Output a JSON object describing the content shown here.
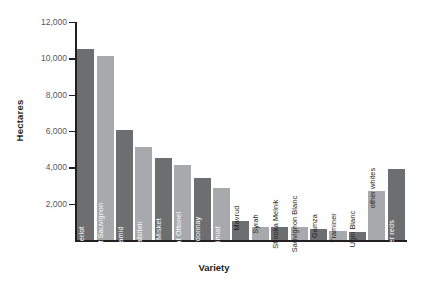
{
  "chart_data": {
    "type": "bar",
    "title": "",
    "xlabel": "Variety",
    "ylabel": "Hectares",
    "ylim": [
      0,
      12000
    ],
    "yticks": [
      2000,
      4000,
      6000,
      8000,
      10000,
      12000
    ],
    "ytick_labels": [
      "2,000",
      "4,000",
      "6,000",
      "8,000",
      "10,000",
      "12,000"
    ],
    "grid": false,
    "legend": "none",
    "categories": [
      "Merlot",
      "Cabernet Sauvignon",
      "Pamid",
      "Rkatsiteli",
      "Red Misket",
      "Muscat Ottonel",
      "Chardonnay",
      "Dimiat",
      "Mavrud",
      "Syrah",
      "Shiroka Melnik",
      "Sauvignon Blanc",
      "Gamza",
      "Traminer",
      "Ugni Blanc",
      "other whites",
      "other reds"
    ],
    "values": [
      10500,
      10150,
      6050,
      5100,
      4500,
      4150,
      3400,
      2850,
      1050,
      700,
      700,
      700,
      600,
      500,
      450,
      2700,
      3900
    ],
    "bar_colors": [
      "#6d6e70",
      "#a7a9ac",
      "#6d6e70",
      "#a7a9ac",
      "#6d6e70",
      "#a7a9ac",
      "#6d6e70",
      "#a7a9ac",
      "#6d6e70",
      "#a7a9ac",
      "#6d6e70",
      "#a7a9ac",
      "#6d6e70",
      "#a7a9ac",
      "#6d6e70",
      "#a7a9ac",
      "#6d6e70"
    ],
    "colors": {
      "dark_gray": "#6d6e70",
      "light_gray": "#a7a9ac",
      "axis": "#231f20",
      "tick_label": "#58595b",
      "background": "#ffffff"
    }
  }
}
